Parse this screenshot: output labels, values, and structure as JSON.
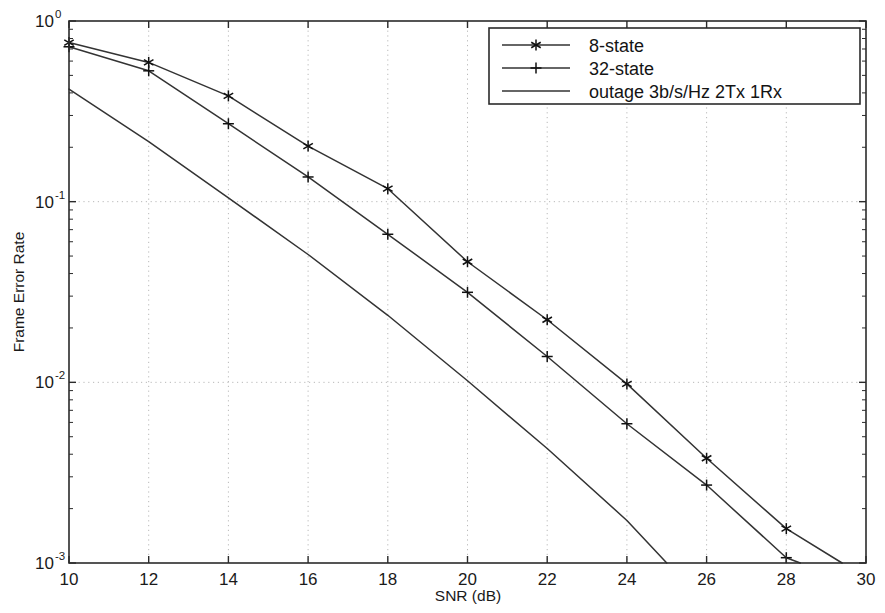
{
  "chart_data": {
    "type": "line",
    "title": "",
    "xlabel": "SNR (dB)",
    "ylabel": "Frame Error Rate",
    "xlim": [
      10,
      30
    ],
    "ylim": [
      0.001,
      1
    ],
    "yscale": "log",
    "grid": true,
    "legend_position": "top-right",
    "xticks": [
      10,
      12,
      14,
      16,
      18,
      20,
      22,
      24,
      26,
      28,
      30
    ],
    "xtick_labels": [
      "10",
      "12",
      "14",
      "16",
      "18",
      "20",
      "22",
      "24",
      "26",
      "28",
      "30"
    ],
    "yticks": [
      1,
      0.1,
      0.01,
      0.001
    ],
    "ytick_labels": [
      "10^0",
      "10^-1",
      "10^-2",
      "10^-3"
    ],
    "ytick_mantissa": "10",
    "ytick_exponents": [
      "0",
      "-1",
      "-2",
      "-3"
    ],
    "series": [
      {
        "name": "8-state",
        "marker": "asterisk",
        "x": [
          10,
          12,
          14,
          16,
          18,
          20,
          22,
          24,
          26,
          28
        ],
        "values": [
          0.76,
          0.59,
          0.385,
          0.203,
          0.118,
          0.0465,
          0.0222,
          0.0098,
          0.0038,
          0.00155
        ],
        "tail_x": [
          28,
          29.4
        ],
        "tail_values": [
          0.00155,
          0.001
        ]
      },
      {
        "name": "32-state",
        "marker": "plus",
        "x": [
          10,
          12,
          14,
          16,
          18,
          20,
          22,
          24,
          26,
          28
        ],
        "values": [
          0.72,
          0.53,
          0.27,
          0.137,
          0.066,
          0.0315,
          0.0139,
          0.0059,
          0.0027,
          0.00107
        ],
        "tail_x": [
          28,
          28.35
        ],
        "tail_values": [
          0.00107,
          0.001
        ]
      },
      {
        "name": "outage 3b/s/Hz 2Tx 1Rx",
        "marker": "none",
        "x": [
          10,
          12,
          14,
          16,
          18,
          20,
          22,
          24,
          25.0
        ],
        "values": [
          0.42,
          0.215,
          0.105,
          0.051,
          0.0235,
          0.0102,
          0.0043,
          0.00172,
          0.001
        ]
      }
    ]
  },
  "legend": {
    "entries": [
      {
        "label": "8-state",
        "marker": "asterisk"
      },
      {
        "label": "32-state",
        "marker": "plus"
      },
      {
        "label": "outage 3b/s/Hz 2Tx 1Rx",
        "marker": "none"
      }
    ]
  },
  "axes": {
    "x_title": "SNR (dB)",
    "y_title": "Frame Error Rate"
  }
}
